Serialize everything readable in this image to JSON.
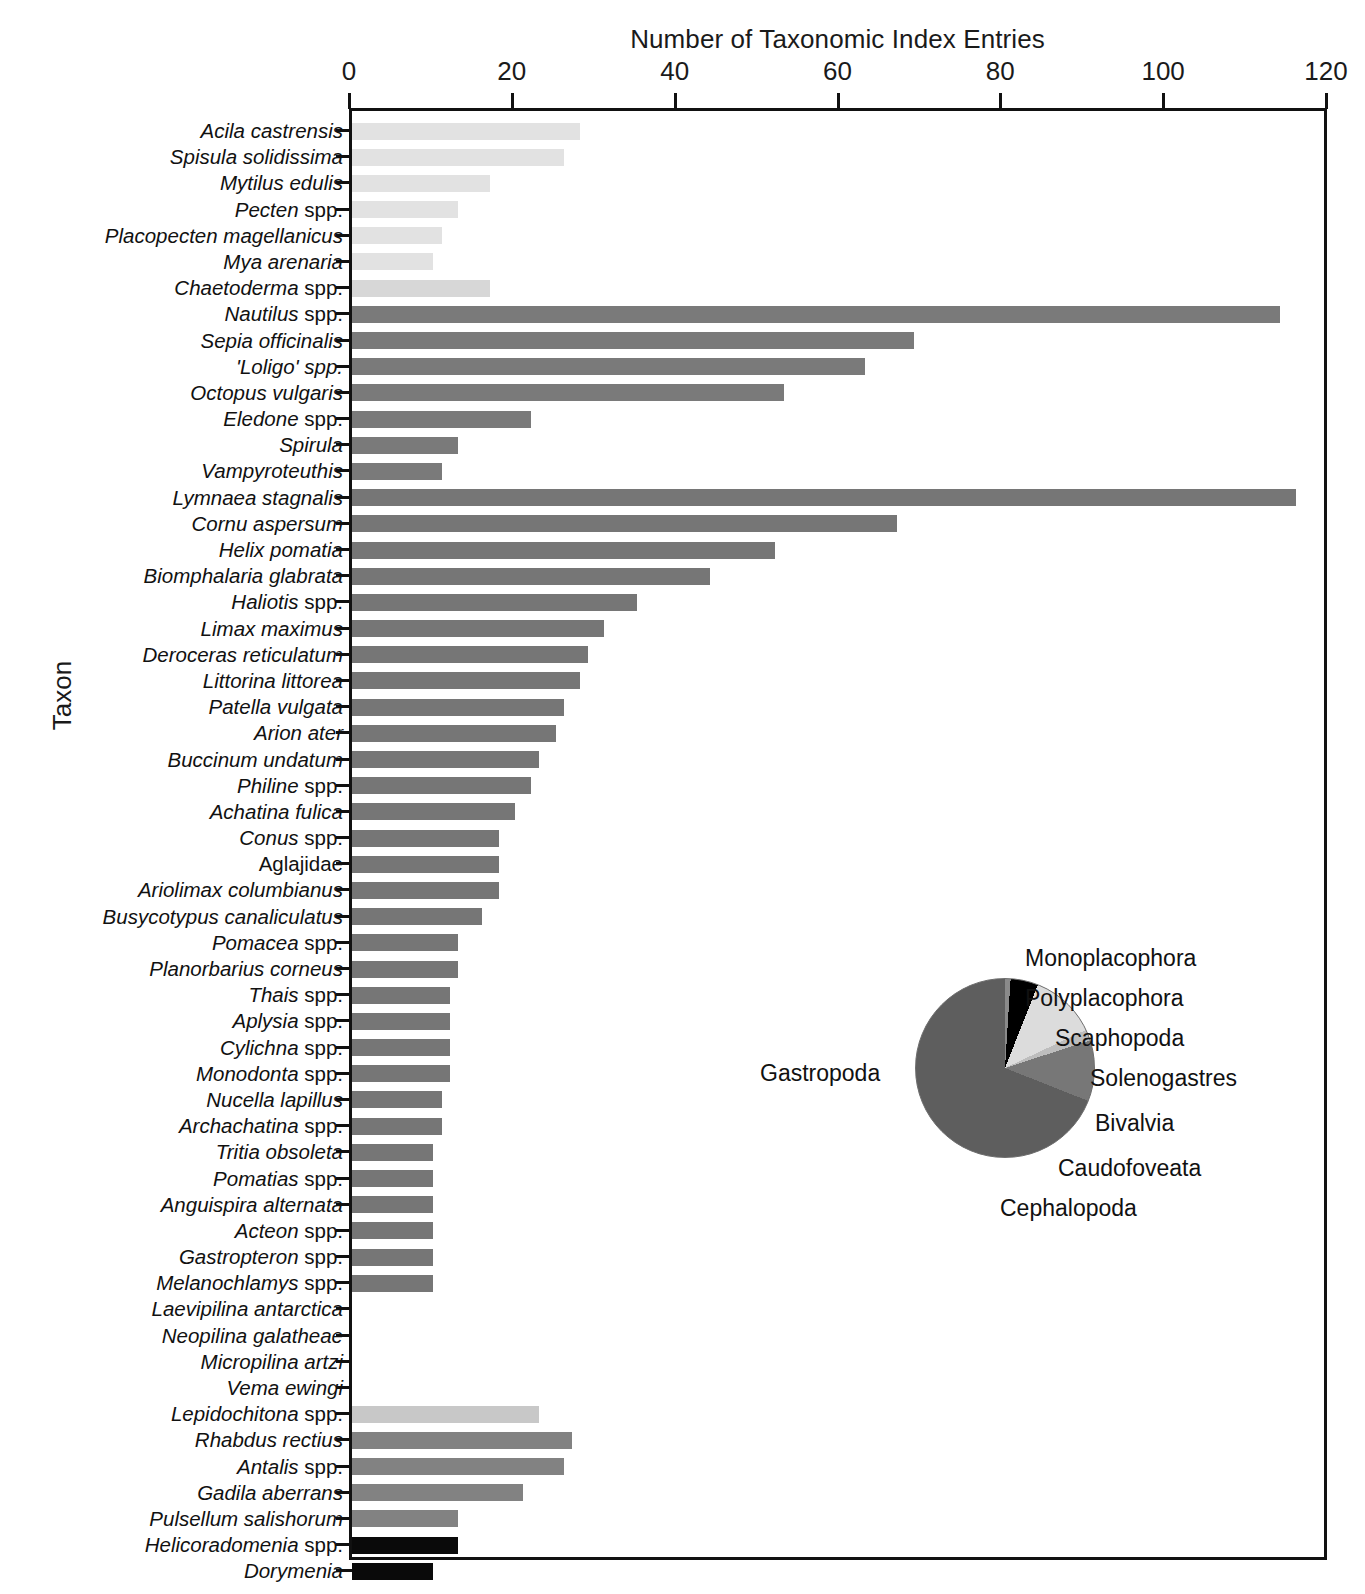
{
  "chart_data": {
    "type": "bar",
    "title": "",
    "xlabel": "Number of Taxonomic Index Entries",
    "ylabel": "Taxon",
    "orientation": "horizontal",
    "xlim": [
      0,
      120
    ],
    "xticks": [
      0,
      20,
      40,
      60,
      80,
      100,
      120
    ],
    "grid": false,
    "legend": "none",
    "categories": [
      "Acila castrensis",
      "Spisula solidissima",
      "Mytilus edulis",
      "Pecten spp.",
      "Placopecten magellanicus",
      "Mya arenaria",
      "Chaetoderma spp.",
      "Nautilus spp.",
      "Sepia officinalis",
      "'Loligo' spp.",
      "Octopus vulgaris",
      "Eledone spp.",
      "Spirula",
      "Vampyroteuthis",
      "Lymnaea stagnalis",
      "Cornu aspersum",
      "Helix pomatia",
      "Biomphalaria glabrata",
      "Haliotis spp.",
      "Limax maximus",
      "Deroceras reticulatum",
      "Littorina littorea",
      "Patella vulgata",
      "Arion ater",
      "Buccinum undatum",
      "Philine spp.",
      "Achatina fulica",
      "Conus spp.",
      "Aglajidae",
      "Ariolimax columbianus",
      "Busycotypus canaliculatus",
      "Pomacea spp.",
      "Planorbarius corneus",
      "Thais spp.",
      "Aplysia spp.",
      "Cylichna spp.",
      "Monodonta spp.",
      "Nucella lapillus",
      "Archachatina spp.",
      "Tritia obsoleta",
      "Pomatias spp.",
      "Anguispira alternata",
      "Acteon spp.",
      "Gastropteron spp.",
      "Melanochlamys spp.",
      "Laevipilina antarctica",
      "Neopilina galatheae",
      "Micropilina artzi",
      "Vema ewingi",
      "Lepidochitona spp.",
      "Rhabdus rectius",
      "Antalis spp.",
      "Gadila aberrans",
      "Pulsellum salishorum",
      "Helicoradomenia spp.",
      "Dorymenia"
    ],
    "values": [
      28,
      26,
      17,
      13,
      11,
      10,
      17,
      114,
      69,
      63,
      53,
      22,
      13,
      11,
      116,
      67,
      52,
      44,
      35,
      31,
      29,
      28,
      26,
      25,
      23,
      22,
      20,
      18,
      18,
      18,
      16,
      13,
      13,
      12,
      12,
      12,
      12,
      11,
      11,
      10,
      10,
      10,
      10,
      10,
      10,
      0,
      0,
      0,
      0,
      23,
      27,
      26,
      21,
      13,
      13,
      10
    ],
    "classes": [
      "Bivalvia",
      "Bivalvia",
      "Bivalvia",
      "Bivalvia",
      "Bivalvia",
      "Bivalvia",
      "Caudofoveata",
      "Cephalopoda",
      "Cephalopoda",
      "Cephalopoda",
      "Cephalopoda",
      "Cephalopoda",
      "Cephalopoda",
      "Cephalopoda",
      "Gastropoda",
      "Gastropoda",
      "Gastropoda",
      "Gastropoda",
      "Gastropoda",
      "Gastropoda",
      "Gastropoda",
      "Gastropoda",
      "Gastropoda",
      "Gastropoda",
      "Gastropoda",
      "Gastropoda",
      "Gastropoda",
      "Gastropoda",
      "Gastropoda",
      "Gastropoda",
      "Gastropoda",
      "Gastropoda",
      "Gastropoda",
      "Gastropoda",
      "Gastropoda",
      "Gastropoda",
      "Gastropoda",
      "Gastropoda",
      "Gastropoda",
      "Gastropoda",
      "Gastropoda",
      "Gastropoda",
      "Gastropoda",
      "Gastropoda",
      "Gastropoda",
      "Monoplacophora",
      "Monoplacophora",
      "Monoplacophora",
      "Monoplacophora",
      "Polyplacophora",
      "Scaphopoda",
      "Scaphopoda",
      "Scaphopoda",
      "Scaphopoda",
      "Solenogastres",
      "Solenogastres"
    ],
    "roman_suffix": [
      "",
      "",
      "",
      "spp.",
      "",
      "",
      "spp.",
      "spp.",
      "",
      "",
      "",
      "spp.",
      "",
      "",
      "",
      "",
      "",
      "",
      "spp.",
      "",
      "",
      "",
      "",
      "",
      "",
      "spp.",
      "",
      "spp.",
      "ALL",
      "",
      "",
      "spp.",
      "",
      "spp.",
      "spp.",
      "spp.",
      "spp.",
      "",
      "spp.",
      "",
      "spp.",
      "",
      "spp.",
      "spp.",
      "spp.",
      "",
      "",
      "",
      "",
      "spp.",
      "",
      "spp.",
      "",
      "",
      "spp.",
      ""
    ]
  },
  "pie_data": {
    "type": "pie",
    "title": "",
    "labels": [
      "Monoplacophora",
      "Polyplacophora",
      "Scaphopoda",
      "Solenogastres",
      "Bivalvia",
      "Caudofoveata",
      "Cephalopoda",
      "Gastropoda"
    ],
    "values": [
      7,
      2,
      7,
      5,
      12,
      2,
      11,
      54
    ],
    "colors": [
      "#ffffff",
      "#c9c9c9",
      "#8a8a8a",
      "#000000",
      "#dcdcdc",
      "#bdbdbd",
      "#777777",
      "#5e5e5e"
    ],
    "legend_position": "right-and-bottom"
  },
  "colors": {
    "bivalvia": "#e2e2e2",
    "caudofoveata": "#d7d7d7",
    "cephalopoda": "#7a7a7a",
    "gastropoda": "#767676",
    "monoplacophora": "#ffffff",
    "polyplacophora": "#c8c8c8",
    "scaphopoda": "#828282",
    "solenogastres": "#0a0a0a",
    "axis": "#111111"
  }
}
